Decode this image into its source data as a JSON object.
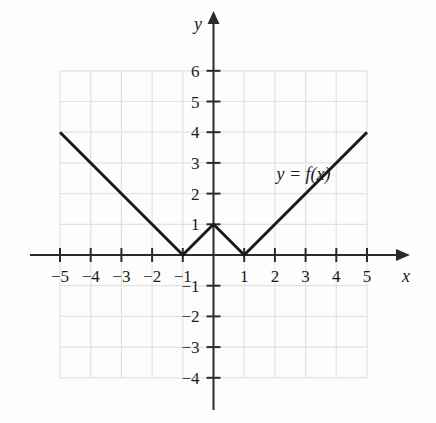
{
  "chart_data": {
    "type": "line",
    "title": "",
    "xlabel": "x",
    "ylabel": "y",
    "curve_label": "y = f(x)",
    "xlim": [
      -5,
      5
    ],
    "ylim": [
      -4,
      6
    ],
    "grid": true,
    "grid_color": "#e2e2e2",
    "axis_color": "#2b2b2b",
    "curve_color": "#1a1a1a",
    "background": "#fdfdfd",
    "x_ticks": [
      -5,
      -4,
      -3,
      -2,
      -1,
      1,
      2,
      3,
      4,
      5
    ],
    "y_ticks": [
      6,
      5,
      4,
      3,
      2,
      1,
      -1,
      -2,
      -3,
      -4
    ],
    "x_tick_labels": [
      "−5",
      "−4",
      "−3",
      "−2",
      "−1",
      "1",
      "2",
      "3",
      "4",
      "5"
    ],
    "y_tick_labels": [
      "6",
      "5",
      "4",
      "3",
      "2",
      "1",
      "−1",
      "−2",
      "−3",
      "−4"
    ],
    "series": [
      {
        "name": "f(x)",
        "points": [
          {
            "x": -5,
            "y": 4
          },
          {
            "x": -1,
            "y": 0
          },
          {
            "x": 0,
            "y": 1
          },
          {
            "x": 1,
            "y": 0
          },
          {
            "x": 5,
            "y": 4
          }
        ]
      }
    ],
    "annotations": [
      {
        "text": "y = f(x)",
        "x": 2.05,
        "y": 2.45
      }
    ],
    "axis_labels": [
      {
        "text": "y",
        "position": "top-of-y-axis"
      },
      {
        "text": "x",
        "position": "right-of-x-axis"
      }
    ]
  }
}
